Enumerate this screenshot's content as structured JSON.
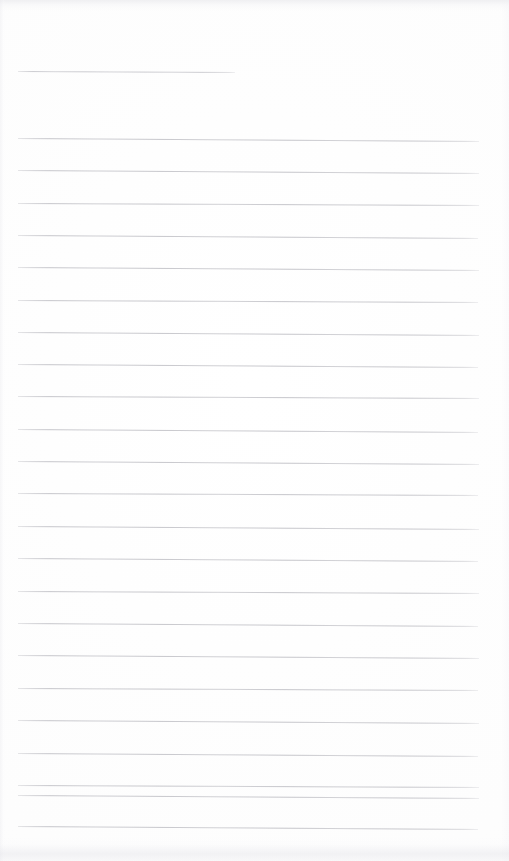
{
  "document": {
    "type": "lined-notebook-page",
    "title_text": "",
    "body_text": "",
    "page_number": "",
    "is_blank": true
  },
  "page": {
    "width": 509,
    "height": 861,
    "background_color": "#fdfdfd",
    "paper_tone": "#fbfbfc"
  },
  "ruling": {
    "line_color": "#c6c6cb",
    "title_line_color": "#cbcbd0",
    "line_thickness": 1,
    "line_spacing": 32.3,
    "left_margin": 18,
    "right_margin": 479,
    "title_rule": {
      "x_start": 18,
      "x_end": 235,
      "y": 71,
      "skew": 1
    },
    "body_rules": [
      {
        "y": 138,
        "x_start": 18,
        "x_end": 479,
        "skew": 3
      },
      {
        "y": 170,
        "x_start": 18,
        "x_end": 479,
        "skew": 3
      },
      {
        "y": 203,
        "x_start": 18,
        "x_end": 479,
        "skew": 2
      },
      {
        "y": 235,
        "x_start": 18,
        "x_end": 478,
        "skew": 3
      },
      {
        "y": 267,
        "x_start": 18,
        "x_end": 479,
        "skew": 3
      },
      {
        "y": 300,
        "x_start": 18,
        "x_end": 478,
        "skew": 2
      },
      {
        "y": 332,
        "x_start": 18,
        "x_end": 479,
        "skew": 3
      },
      {
        "y": 364,
        "x_start": 18,
        "x_end": 478,
        "skew": 3
      },
      {
        "y": 396,
        "x_start": 18,
        "x_end": 479,
        "skew": 2
      },
      {
        "y": 429,
        "x_start": 18,
        "x_end": 478,
        "skew": 3
      },
      {
        "y": 461,
        "x_start": 18,
        "x_end": 479,
        "skew": 3
      },
      {
        "y": 493,
        "x_start": 18,
        "x_end": 478,
        "skew": 2
      },
      {
        "y": 526,
        "x_start": 18,
        "x_end": 479,
        "skew": 3
      },
      {
        "y": 558,
        "x_start": 18,
        "x_end": 478,
        "skew": 3
      },
      {
        "y": 591,
        "x_start": 18,
        "x_end": 479,
        "skew": 2
      },
      {
        "y": 623,
        "x_start": 18,
        "x_end": 478,
        "skew": 3
      },
      {
        "y": 655,
        "x_start": 18,
        "x_end": 479,
        "skew": 3
      },
      {
        "y": 688,
        "x_start": 18,
        "x_end": 478,
        "skew": 2
      },
      {
        "y": 720,
        "x_start": 18,
        "x_end": 479,
        "skew": 3
      },
      {
        "y": 753,
        "x_start": 18,
        "x_end": 478,
        "skew": 3
      },
      {
        "y": 785,
        "x_start": 18,
        "x_end": 479,
        "skew": 2
      },
      {
        "y": 795,
        "x_start": 18,
        "x_end": 479,
        "skew": 3
      },
      {
        "y": 826,
        "x_start": 18,
        "x_end": 478,
        "skew": 3
      }
    ]
  },
  "artifacts": {
    "top_band": {
      "y": 0,
      "height": 11,
      "color": "#e4e4e8"
    },
    "bottom_band": {
      "y": 838,
      "height": 23,
      "color": "#e6e6eb"
    },
    "left_edge": {
      "x": 0,
      "width": 6,
      "color": "#eaeaee"
    }
  }
}
